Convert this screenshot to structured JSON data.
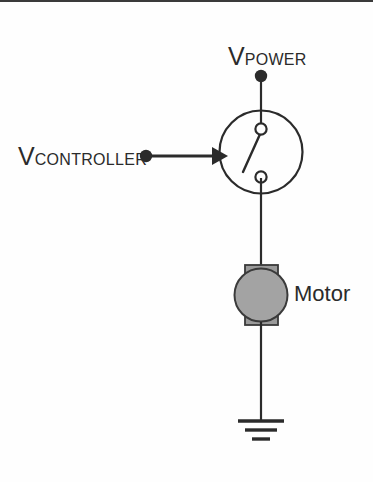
{
  "diagram": {
    "title_visible": false,
    "background_color": "#fefefe",
    "line_color": "#2b2b2b",
    "motor_fill_color": "#a3a3a3",
    "motor_block_color": "#9a9a9a"
  },
  "labels": {
    "power_supply": {
      "symbol": "V",
      "subscript": "POWER",
      "name": "V_POWER"
    },
    "controller_input": {
      "symbol": "V",
      "subscript": "CONTROLLER",
      "name": "V_CONTROLLER"
    },
    "motor": "Motor"
  },
  "components": [
    {
      "id": "power-terminal",
      "type": "terminal-node",
      "label": "V_POWER",
      "x": 261,
      "y": 76
    },
    {
      "id": "relay-switch",
      "type": "relay-switch",
      "shape": "circle",
      "center_x": 261,
      "center_y": 152,
      "radius": 42,
      "terminals": 2,
      "state": "open"
    },
    {
      "id": "controller-terminal",
      "type": "terminal-node",
      "label": "V_CONTROLLER",
      "x": 147,
      "y": 156
    },
    {
      "id": "control-arrow",
      "type": "arrow",
      "from_x": 147,
      "from_y": 156,
      "to_x": 220,
      "to_y": 156,
      "direction": "right"
    },
    {
      "id": "motor",
      "type": "motor",
      "label": "Motor",
      "center_x": 261,
      "center_y": 295,
      "radius": 27
    },
    {
      "id": "ground",
      "type": "ground",
      "x": 261,
      "y": 420,
      "bars": 3
    }
  ],
  "wires": [
    {
      "id": "wire-power-to-switch",
      "x1": 261,
      "y1": 76,
      "x2": 261,
      "y2": 130
    },
    {
      "id": "wire-switch-to-motor",
      "x1": 261,
      "y1": 178,
      "x2": 261,
      "y2": 266
    },
    {
      "id": "wire-motor-to-ground",
      "x1": 261,
      "y1": 324,
      "x2": 261,
      "y2": 420
    }
  ]
}
